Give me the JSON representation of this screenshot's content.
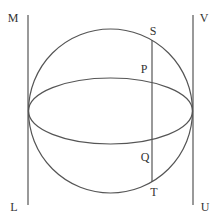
{
  "diagram": {
    "type": "geometry",
    "stroke_color": "#555555",
    "label_color": "#333333",
    "labels": {
      "M": "M",
      "V": "V",
      "L": "L",
      "U": "U",
      "S": "S",
      "P": "P",
      "Q": "Q",
      "T": "T"
    },
    "shapes": {
      "circle": {
        "cx": 110.5,
        "cy": 111,
        "r": 82
      },
      "ellipse": {
        "cx": 110.5,
        "cy": 111,
        "rx": 82,
        "ry": 33
      },
      "left_line": {
        "x": 28,
        "y1": 15,
        "y2": 205,
        "top_label": "M",
        "bottom_label": "L"
      },
      "right_line": {
        "x": 193,
        "y1": 15,
        "y2": 205,
        "top_label": "V",
        "bottom_label": "U"
      },
      "chord": {
        "x": 152,
        "points": [
          "S",
          "P",
          "Q",
          "T"
        ]
      }
    }
  }
}
